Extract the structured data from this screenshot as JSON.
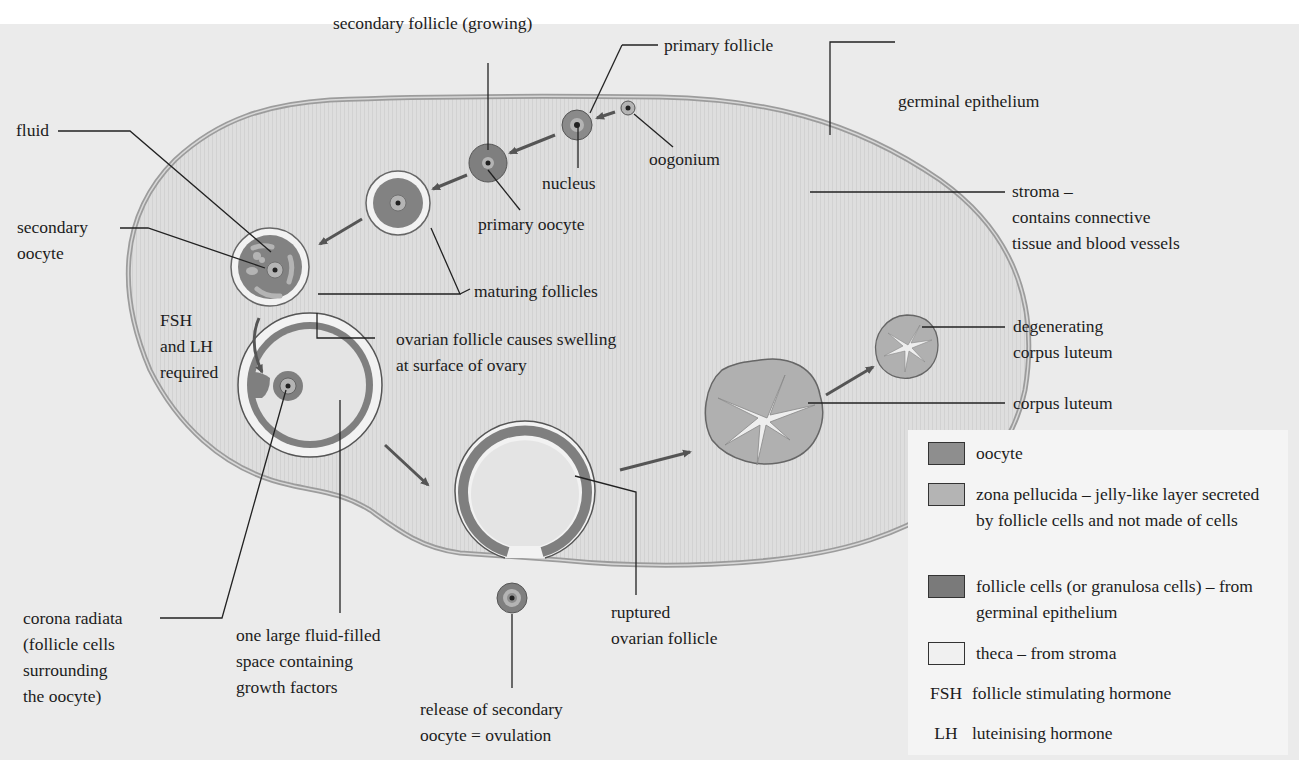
{
  "diagram": {
    "colors": {
      "background": "#ebebeb",
      "stroma": "#dcdcdc",
      "oocyte": "#8e8e8e",
      "zona_pellucida": "#b4b4b4",
      "follicle_cells": "#7a7a7a",
      "theca": "#f0f0f0",
      "outline": "#3a3a3a",
      "germinal_epithelium": "#a9a9a9"
    },
    "labels": {
      "secondary_follicle": "secondary follicle (growing)",
      "primary_follicle": "primary follicle",
      "germinal_epithelium": "germinal epithelium",
      "fluid": "fluid",
      "oogonium": "oogonium",
      "nucleus": "nucleus",
      "primary_oocyte": "primary oocyte",
      "stroma_line1": "stroma –",
      "stroma_line2": "contains connective",
      "stroma_line3": "tissue and blood vessels",
      "secondary_oocyte_line1": "secondary",
      "secondary_oocyte_line2": "oocyte",
      "maturing_follicles": "maturing follicles",
      "fsh_lh_line1": "FSH",
      "fsh_lh_line2": "and LH",
      "fsh_lh_line3": "required",
      "swelling_line1": "ovarian follicle causes swelling",
      "swelling_line2": "at surface of ovary",
      "degenerating_line1": "degenerating",
      "degenerating_line2": "corpus luteum",
      "corpus_luteum": "corpus luteum",
      "corona_line1": "corona radiata",
      "corona_line2": "(follicle cells",
      "corona_line3": "surrounding",
      "corona_line4": "the oocyte)",
      "fluid_space_line1": "one large fluid-filled",
      "fluid_space_line2": "space containing",
      "fluid_space_line3": "growth factors",
      "ruptured_line1": "ruptured",
      "ruptured_line2": "ovarian follicle",
      "ovulation_line1": "release of secondary",
      "ovulation_line2": "oocyte = ovulation"
    }
  },
  "legend": {
    "items": [
      {
        "type": "swatch",
        "color": "#8e8e8e",
        "label": "oocyte"
      },
      {
        "type": "swatch",
        "color": "#b4b4b4",
        "label": "zona pellucida – jelly-like layer secreted by follicle cells and not made of cells"
      },
      {
        "type": "swatch",
        "color": "#7a7a7a",
        "label": "follicle cells (or granulosa cells) – from germinal epithelium"
      },
      {
        "type": "swatch",
        "color": "#f0f0f0",
        "label": "theca – from stroma"
      },
      {
        "type": "abbr",
        "abbr": "FSH",
        "label": "follicle stimulating hormone"
      },
      {
        "type": "abbr",
        "abbr": "LH",
        "label": "luteinising hormone"
      }
    ]
  }
}
